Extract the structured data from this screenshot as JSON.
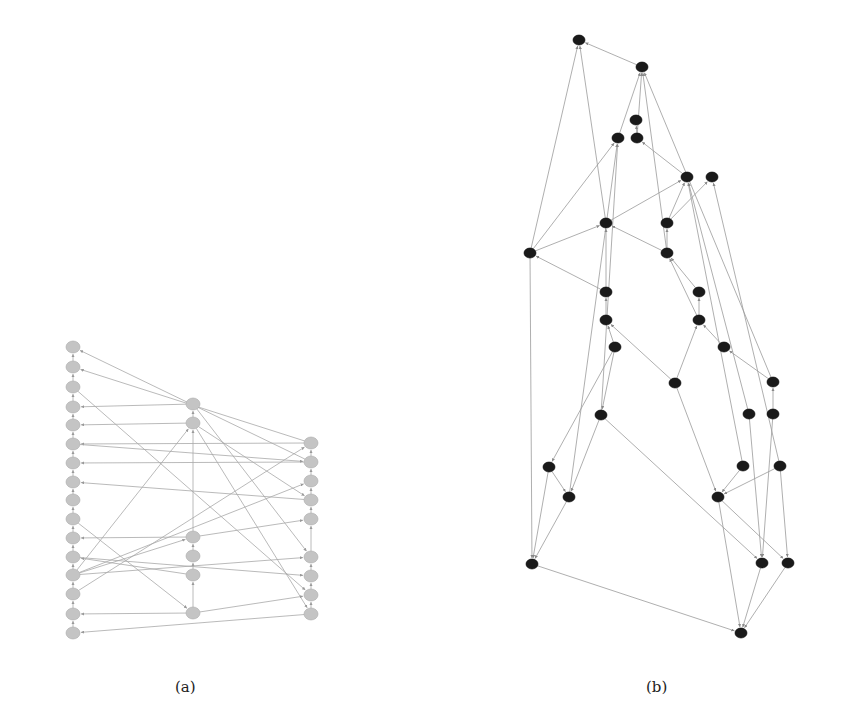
{
  "figure": {
    "panels": [
      {
        "id": "a",
        "caption": "(a)",
        "node_style": {
          "fill": "#c4c4c4",
          "stroke": "#aaaaaa",
          "rx": 7,
          "ry": 6
        },
        "edge_color": "#a8a8a8",
        "nodes": [
          {
            "id": "L1",
            "x": 73,
            "y": 347
          },
          {
            "id": "L2",
            "x": 73,
            "y": 367
          },
          {
            "id": "L3",
            "x": 73,
            "y": 387
          },
          {
            "id": "L4",
            "x": 73,
            "y": 407
          },
          {
            "id": "L5",
            "x": 73,
            "y": 425
          },
          {
            "id": "L6",
            "x": 73,
            "y": 444
          },
          {
            "id": "L7",
            "x": 73,
            "y": 463
          },
          {
            "id": "L8",
            "x": 73,
            "y": 482
          },
          {
            "id": "L9",
            "x": 73,
            "y": 500
          },
          {
            "id": "L10",
            "x": 73,
            "y": 519
          },
          {
            "id": "L11",
            "x": 73,
            "y": 538
          },
          {
            "id": "L12",
            "x": 73,
            "y": 557
          },
          {
            "id": "L13",
            "x": 73,
            "y": 575
          },
          {
            "id": "L14",
            "x": 73,
            "y": 594
          },
          {
            "id": "L15",
            "x": 73,
            "y": 614
          },
          {
            "id": "L16",
            "x": 73,
            "y": 633
          },
          {
            "id": "M1",
            "x": 193,
            "y": 404
          },
          {
            "id": "M2",
            "x": 193,
            "y": 423
          },
          {
            "id": "M3",
            "x": 193,
            "y": 537
          },
          {
            "id": "M4",
            "x": 193,
            "y": 556
          },
          {
            "id": "M5",
            "x": 193,
            "y": 575
          },
          {
            "id": "M6",
            "x": 193,
            "y": 613
          },
          {
            "id": "R1",
            "x": 311,
            "y": 443
          },
          {
            "id": "R2",
            "x": 311,
            "y": 462
          },
          {
            "id": "R3",
            "x": 311,
            "y": 481
          },
          {
            "id": "R4",
            "x": 311,
            "y": 500
          },
          {
            "id": "R5",
            "x": 311,
            "y": 519
          },
          {
            "id": "R6",
            "x": 311,
            "y": 557
          },
          {
            "id": "R7",
            "x": 311,
            "y": 576
          },
          {
            "id": "R8",
            "x": 311,
            "y": 595
          },
          {
            "id": "R9",
            "x": 311,
            "y": 614
          }
        ],
        "edges": [
          [
            "L2",
            "L1"
          ],
          [
            "L3",
            "L2"
          ],
          [
            "L4",
            "L3"
          ],
          [
            "L5",
            "L4"
          ],
          [
            "L6",
            "L5"
          ],
          [
            "L7",
            "L6"
          ],
          [
            "L8",
            "L7"
          ],
          [
            "L9",
            "L8"
          ],
          [
            "L10",
            "L9"
          ],
          [
            "L11",
            "L10"
          ],
          [
            "L12",
            "L11"
          ],
          [
            "L13",
            "L12"
          ],
          [
            "L14",
            "L13"
          ],
          [
            "L15",
            "L14"
          ],
          [
            "L16",
            "L15"
          ],
          [
            "M2",
            "M1"
          ],
          [
            "M3",
            "M2"
          ],
          [
            "M4",
            "M3"
          ],
          [
            "M5",
            "M4"
          ],
          [
            "M6",
            "M5"
          ],
          [
            "R2",
            "R1"
          ],
          [
            "R3",
            "R2"
          ],
          [
            "R4",
            "R3"
          ],
          [
            "R5",
            "R4"
          ],
          [
            "R6",
            "R5"
          ],
          [
            "R7",
            "R6"
          ],
          [
            "R8",
            "R7"
          ],
          [
            "R9",
            "R8"
          ],
          [
            "R2",
            "L1"
          ],
          [
            "R1",
            "L2"
          ],
          [
            "M1",
            "L4"
          ],
          [
            "M2",
            "L5"
          ],
          [
            "R1",
            "L6"
          ],
          [
            "R2",
            "L7"
          ],
          [
            "R4",
            "L8"
          ],
          [
            "M3",
            "L11"
          ],
          [
            "M5",
            "L12"
          ],
          [
            "M6",
            "L15"
          ],
          [
            "R9",
            "L16"
          ],
          [
            "L3",
            "R8"
          ],
          [
            "L10",
            "M6"
          ],
          [
            "L13",
            "R3"
          ],
          [
            "L13",
            "R6"
          ],
          [
            "L13",
            "M3"
          ],
          [
            "L13",
            "M2"
          ],
          [
            "L12",
            "R7"
          ],
          [
            "M1",
            "R6"
          ],
          [
            "M2",
            "R9"
          ],
          [
            "M3",
            "R5"
          ],
          [
            "M6",
            "R8"
          ],
          [
            "L6",
            "R2"
          ],
          [
            "M2",
            "R4"
          ],
          [
            "L14",
            "R1"
          ]
        ]
      },
      {
        "id": "b",
        "caption": "(b)",
        "node_style": {
          "fill": "#1a1a1a",
          "stroke": "#000000",
          "rx": 6,
          "ry": 5
        },
        "edge_color": "#9a9a9a",
        "nodes": [
          {
            "id": "n1",
            "x": 579,
            "y": 40
          },
          {
            "id": "n2",
            "x": 642,
            "y": 67
          },
          {
            "id": "n3",
            "x": 636,
            "y": 120
          },
          {
            "id": "n4",
            "x": 618,
            "y": 138
          },
          {
            "id": "n5",
            "x": 637,
            "y": 138
          },
          {
            "id": "n6",
            "x": 687,
            "y": 177
          },
          {
            "id": "n7",
            "x": 712,
            "y": 177
          },
          {
            "id": "n8",
            "x": 606,
            "y": 223
          },
          {
            "id": "n9",
            "x": 667,
            "y": 223
          },
          {
            "id": "n10",
            "x": 530,
            "y": 253
          },
          {
            "id": "n11",
            "x": 667,
            "y": 253
          },
          {
            "id": "n12",
            "x": 606,
            "y": 292
          },
          {
            "id": "n13",
            "x": 699,
            "y": 292
          },
          {
            "id": "n14",
            "x": 606,
            "y": 320
          },
          {
            "id": "n15",
            "x": 699,
            "y": 320
          },
          {
            "id": "n16",
            "x": 615,
            "y": 347
          },
          {
            "id": "n17",
            "x": 724,
            "y": 347
          },
          {
            "id": "n18",
            "x": 675,
            "y": 383
          },
          {
            "id": "n19",
            "x": 773,
            "y": 382
          },
          {
            "id": "n20",
            "x": 601,
            "y": 415
          },
          {
            "id": "n21",
            "x": 749,
            "y": 414
          },
          {
            "id": "n22",
            "x": 773,
            "y": 414
          },
          {
            "id": "n23",
            "x": 549,
            "y": 467
          },
          {
            "id": "n24",
            "x": 743,
            "y": 466
          },
          {
            "id": "n25",
            "x": 780,
            "y": 466
          },
          {
            "id": "n26",
            "x": 569,
            "y": 497
          },
          {
            "id": "n27",
            "x": 718,
            "y": 497
          },
          {
            "id": "n28",
            "x": 532,
            "y": 564
          },
          {
            "id": "n29",
            "x": 762,
            "y": 563
          },
          {
            "id": "n30",
            "x": 788,
            "y": 563
          },
          {
            "id": "n31",
            "x": 741,
            "y": 633
          }
        ],
        "edges": [
          [
            "n2",
            "n1"
          ],
          [
            "n10",
            "n1"
          ],
          [
            "n8",
            "n1"
          ],
          [
            "n19",
            "n2"
          ],
          [
            "n4",
            "n2"
          ],
          [
            "n5",
            "n2"
          ],
          [
            "n11",
            "n2"
          ],
          [
            "n5",
            "n3"
          ],
          [
            "n6",
            "n5"
          ],
          [
            "n10",
            "n4"
          ],
          [
            "n26",
            "n4"
          ],
          [
            "n20",
            "n4"
          ],
          [
            "n10",
            "n8"
          ],
          [
            "n12",
            "n8"
          ],
          [
            "n11",
            "n8"
          ],
          [
            "n9",
            "n6"
          ],
          [
            "n8",
            "n6"
          ],
          [
            "n9",
            "n7"
          ],
          [
            "n24",
            "n6"
          ],
          [
            "n21",
            "n6"
          ],
          [
            "n25",
            "n7"
          ],
          [
            "n11",
            "n9"
          ],
          [
            "n15",
            "n11"
          ],
          [
            "n13",
            "n11"
          ],
          [
            "n12",
            "n10"
          ],
          [
            "n14",
            "n12"
          ],
          [
            "n16",
            "n14"
          ],
          [
            "n18",
            "n14"
          ],
          [
            "n15",
            "n13"
          ],
          [
            "n18",
            "n15"
          ],
          [
            "n17",
            "n15"
          ],
          [
            "n19",
            "n17"
          ],
          [
            "n22",
            "n19"
          ],
          [
            "n16",
            "n20"
          ],
          [
            "n20",
            "n26"
          ],
          [
            "n23",
            "n26"
          ],
          [
            "n20",
            "n29"
          ],
          [
            "n18",
            "n27"
          ],
          [
            "n24",
            "n27"
          ],
          [
            "n25",
            "n27"
          ],
          [
            "n21",
            "n29"
          ],
          [
            "n22",
            "n29"
          ],
          [
            "n26",
            "n28"
          ],
          [
            "n27",
            "n31"
          ],
          [
            "n28",
            "n31"
          ],
          [
            "n29",
            "n31"
          ],
          [
            "n30",
            "n31"
          ],
          [
            "n27",
            "n30"
          ],
          [
            "n10",
            "n28"
          ],
          [
            "n23",
            "n28"
          ],
          [
            "n25",
            "n30"
          ],
          [
            "n16",
            "n23"
          ]
        ]
      }
    ]
  }
}
